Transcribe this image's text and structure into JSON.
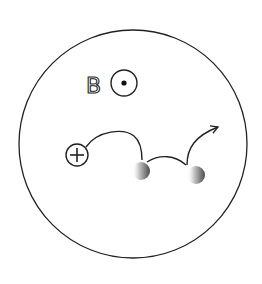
{
  "diagram": {
    "field_label": "B",
    "field_direction": "out-of-page",
    "charge_symbol": "+",
    "charge_label": "positive charge",
    "scatterers": 2,
    "colors": {
      "stroke": "#222222",
      "background": "#ffffff",
      "scatterer_dark": "#555555",
      "scatterer_light": "#e6e6e6"
    }
  }
}
